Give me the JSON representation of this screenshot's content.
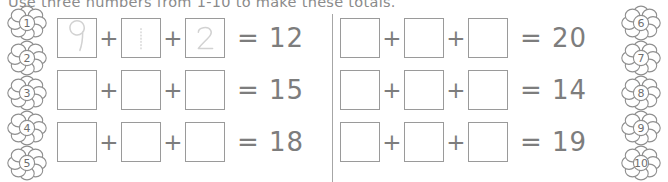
{
  "worksheet": {
    "title": "Use three numbers from 1-10 to make these totals.",
    "operator": "+",
    "equals_prefix": "="
  },
  "decorations": {
    "flowers_left": [
      {
        "label": "1",
        "icon": "flower-icon"
      },
      {
        "label": "2",
        "icon": "flower-icon"
      },
      {
        "label": "3",
        "icon": "flower-icon"
      },
      {
        "label": "4",
        "icon": "flower-icon"
      },
      {
        "label": "5",
        "icon": "flower-icon"
      }
    ],
    "flowers_right": [
      {
        "label": "6",
        "icon": "flower-icon"
      },
      {
        "label": "7",
        "icon": "flower-icon"
      },
      {
        "label": "8",
        "icon": "flower-icon"
      },
      {
        "label": "9",
        "icon": "flower-icon"
      },
      {
        "label": "10",
        "icon": "flower-icon"
      }
    ]
  },
  "columns": {
    "left": {
      "rows": [
        {
          "boxes": [
            "9",
            "1",
            "2"
          ],
          "traced": true,
          "total": "= 12"
        },
        {
          "boxes": [
            "",
            "",
            ""
          ],
          "traced": false,
          "total": "= 15"
        },
        {
          "boxes": [
            "",
            "",
            ""
          ],
          "traced": false,
          "total": "= 18"
        }
      ]
    },
    "right": {
      "rows": [
        {
          "boxes": [
            "",
            "",
            ""
          ],
          "traced": false,
          "total": "= 20"
        },
        {
          "boxes": [
            "",
            "",
            ""
          ],
          "traced": false,
          "total": "= 14"
        },
        {
          "boxes": [
            "",
            "",
            ""
          ],
          "traced": false,
          "total": "= 19"
        }
      ]
    }
  },
  "colors": {
    "ink": "#7d7d7d",
    "box_border": "#9a9a9a",
    "trace_guide": "#d2d2d2",
    "divider": "#a6a6a6"
  }
}
